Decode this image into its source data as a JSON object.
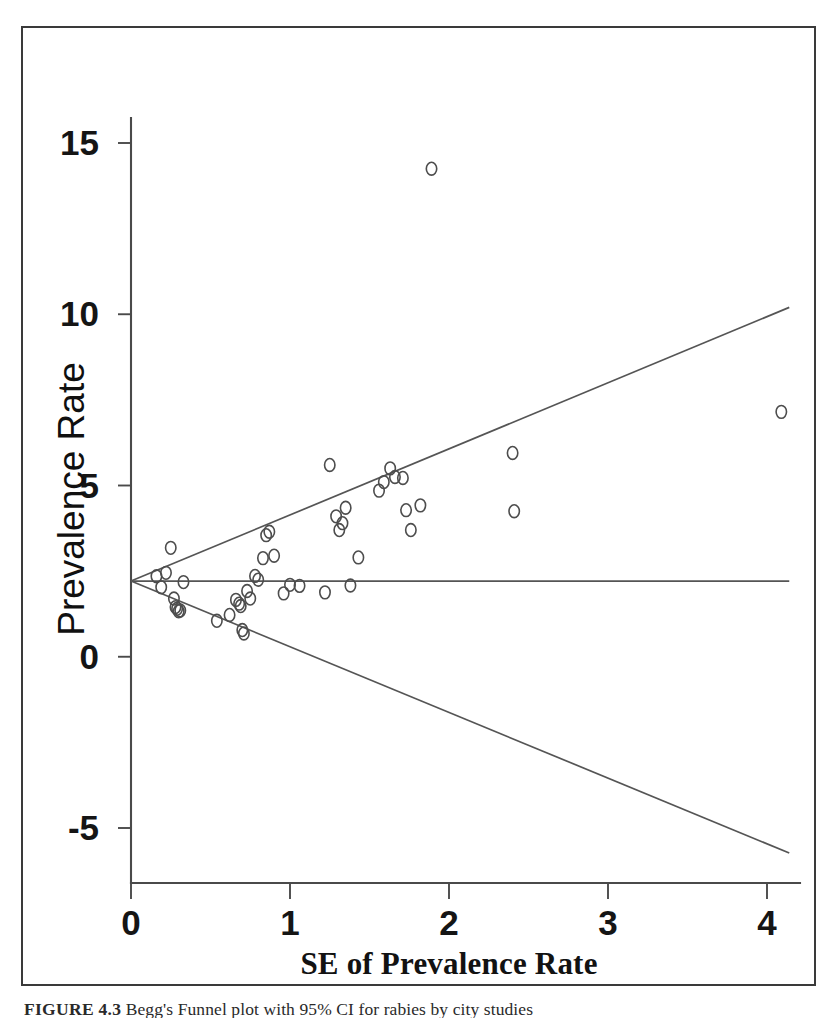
{
  "figure": {
    "caption_label": "FIGURE 4.3",
    "caption_text": "Begg's Funnel plot with 95% CI for rabies by city studies"
  },
  "chart_data": {
    "type": "scatter",
    "title": "",
    "subtitle": "",
    "xlabel": "SE of Prevalence Rate",
    "ylabel": "Prevalence Rate",
    "xlim": [
      0,
      4.14
    ],
    "ylim": [
      -6.2,
      15.9
    ],
    "xticks": [
      0,
      1,
      2,
      3,
      4
    ],
    "xticklabels": [
      "0",
      "1",
      "2",
      "3",
      "4"
    ],
    "yticks": [
      -5,
      0,
      5,
      10,
      15
    ],
    "yticklabels": [
      "-5",
      "0",
      "5",
      "10",
      "15"
    ],
    "grid": false,
    "legend": "none",
    "marker": "open-circle",
    "pooled_estimate": 2.21,
    "ci_level": "95%",
    "reference_lines": [
      {
        "name": "pooled-effect-line",
        "kind": "horizontal",
        "y": 2.21,
        "x_from": 0,
        "x_to": 4.14
      },
      {
        "name": "upper-95-ci-line",
        "kind": "funnel-upper",
        "from": [
          0,
          2.21
        ],
        "to": [
          4.14,
          10.2
        ]
      },
      {
        "name": "lower-95-ci-line",
        "kind": "funnel-lower",
        "from": [
          0,
          2.21
        ],
        "to": [
          4.14,
          -5.73
        ]
      }
    ],
    "series": [
      {
        "name": "Studies",
        "x": [
          0.16,
          0.19,
          0.22,
          0.25,
          0.27,
          0.28,
          0.29,
          0.3,
          0.31,
          0.33,
          0.54,
          0.62,
          0.66,
          0.68,
          0.69,
          0.7,
          0.71,
          0.73,
          0.75,
          0.78,
          0.8,
          0.83,
          0.85,
          0.87,
          0.9,
          0.96,
          1.0,
          1.06,
          1.22,
          1.25,
          1.29,
          1.31,
          1.33,
          1.35,
          1.38,
          1.43,
          1.56,
          1.59,
          1.63,
          1.66,
          1.71,
          1.73,
          1.76,
          1.82,
          1.89,
          2.4,
          2.41,
          4.09
        ],
        "y": [
          2.35,
          2.03,
          2.45,
          3.18,
          1.7,
          1.45,
          1.4,
          1.33,
          1.35,
          2.18,
          1.05,
          1.22,
          1.66,
          1.55,
          1.48,
          0.78,
          0.68,
          1.92,
          1.7,
          2.36,
          2.25,
          2.88,
          3.55,
          3.65,
          2.95,
          1.85,
          2.1,
          2.07,
          1.88,
          5.6,
          4.1,
          3.7,
          3.9,
          4.35,
          2.08,
          2.9,
          4.85,
          5.1,
          5.5,
          5.25,
          5.22,
          4.28,
          3.7,
          4.42,
          14.25,
          5.95,
          4.25,
          7.15
        ]
      }
    ]
  }
}
